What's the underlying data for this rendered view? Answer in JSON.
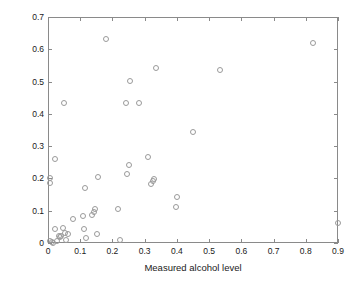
{
  "chart_data": {
    "type": "scatter",
    "title": "",
    "xlabel": "Measured alcohol level",
    "ylabel": "Size of the forehead hottest area[% of total image]",
    "xlim": [
      0,
      0.9
    ],
    "ylim": [
      0,
      0.7
    ],
    "xticks": [
      0,
      0.1,
      0.2,
      0.3,
      0.4,
      0.5,
      0.6,
      0.7,
      0.8,
      0.9
    ],
    "xticklabels": [
      "0",
      "0.1",
      "0.2",
      "0.3",
      "0.4",
      "0.5",
      "0.6",
      "0.7",
      "0.8",
      "0.9"
    ],
    "yticks": [
      0,
      0.1,
      0.2,
      0.3,
      0.4,
      0.5,
      0.6,
      0.7
    ],
    "yticklabels": [
      "0",
      "0.1",
      "0.2",
      "0.3",
      "0.4",
      "0.5",
      "0.6",
      "0.7"
    ],
    "grid": false,
    "legend": null,
    "marker": "open-circle",
    "marker_color": "#9a9a9a",
    "axis_color": "#8a8a8a",
    "points": [
      [
        0.003,
        0.205
      ],
      [
        0.004,
        0.188
      ],
      [
        0.004,
        0.01
      ],
      [
        0.008,
        0.005
      ],
      [
        0.012,
        0.004
      ],
      [
        0.018,
        0.046
      ],
      [
        0.02,
        0.262
      ],
      [
        0.026,
        0.008
      ],
      [
        0.03,
        0.024
      ],
      [
        0.034,
        0.022
      ],
      [
        0.038,
        0.024
      ],
      [
        0.043,
        0.049
      ],
      [
        0.047,
        0.437
      ],
      [
        0.05,
        0.035
      ],
      [
        0.054,
        0.012
      ],
      [
        0.058,
        0.03
      ],
      [
        0.075,
        0.078
      ],
      [
        0.105,
        0.086
      ],
      [
        0.108,
        0.048
      ],
      [
        0.112,
        0.172
      ],
      [
        0.114,
        0.02
      ],
      [
        0.133,
        0.09
      ],
      [
        0.14,
        0.098
      ],
      [
        0.144,
        0.108
      ],
      [
        0.148,
        0.03
      ],
      [
        0.152,
        0.208
      ],
      [
        0.178,
        0.636
      ],
      [
        0.213,
        0.108
      ],
      [
        0.219,
        0.013
      ],
      [
        0.238,
        0.436
      ],
      [
        0.243,
        0.216
      ],
      [
        0.248,
        0.246
      ],
      [
        0.252,
        0.506
      ],
      [
        0.279,
        0.436
      ],
      [
        0.308,
        0.27
      ],
      [
        0.315,
        0.186
      ],
      [
        0.322,
        0.194
      ],
      [
        0.327,
        0.2
      ],
      [
        0.331,
        0.545
      ],
      [
        0.394,
        0.115
      ],
      [
        0.397,
        0.147
      ],
      [
        0.448,
        0.348
      ],
      [
        0.531,
        0.539
      ],
      [
        0.818,
        0.623
      ],
      [
        0.897,
        0.066
      ]
    ]
  }
}
